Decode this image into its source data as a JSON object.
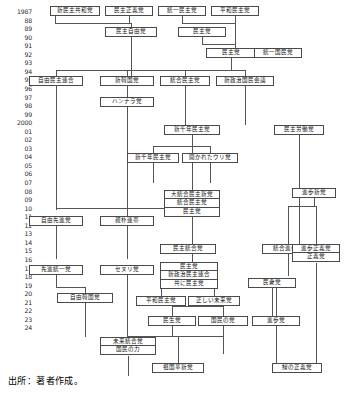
{
  "figure": {
    "caption": "出所：著者作成。",
    "years": [
      "1987",
      "88",
      "89",
      "90",
      "91",
      "92",
      "93",
      "94",
      "95",
      "96",
      "97",
      "98",
      "99",
      "2000",
      "01",
      "02",
      "03",
      "04",
      "05",
      "06",
      "07",
      "08",
      "09",
      "10",
      "11",
      "12",
      "13",
      "14",
      "15",
      "16",
      "17",
      "18",
      "19",
      "20",
      "21",
      "22",
      "23",
      "24"
    ]
  },
  "nodes": [
    {
      "id": "n1",
      "label": "新民主共和党",
      "x": 50,
      "y": 6,
      "w": 50,
      "h": 10
    },
    {
      "id": "n2",
      "label": "民主正義党",
      "x": 105,
      "y": 6,
      "w": 48,
      "h": 10
    },
    {
      "id": "n3",
      "label": "統一民主党",
      "x": 158,
      "y": 6,
      "w": 48,
      "h": 10
    },
    {
      "id": "n4",
      "label": "平和民主党",
      "x": 211,
      "y": 6,
      "w": 48,
      "h": 10
    },
    {
      "id": "n5",
      "label": "民主自由党",
      "x": 105,
      "y": 27,
      "w": 52,
      "h": 10
    },
    {
      "id": "n6",
      "label": "民主党",
      "x": 178,
      "y": 27,
      "w": 48,
      "h": 10
    },
    {
      "id": "n7",
      "label": "民主党",
      "x": 206,
      "y": 48,
      "w": 50,
      "h": 10
    },
    {
      "id": "n8",
      "label": "統一国民党",
      "x": 254,
      "y": 48,
      "w": 48,
      "h": 10
    },
    {
      "id": "n9",
      "label": "自由民主連合",
      "x": 29,
      "y": 76,
      "w": 54,
      "h": 10
    },
    {
      "id": "n10",
      "label": "新韓国党",
      "x": 100,
      "y": 76,
      "w": 54,
      "h": 10
    },
    {
      "id": "n11",
      "label": "統合民主党",
      "x": 160,
      "y": 76,
      "w": 50,
      "h": 10
    },
    {
      "id": "n12",
      "label": "新政治国民会議",
      "x": 216,
      "y": 76,
      "w": 58,
      "h": 10
    },
    {
      "id": "n13",
      "label": "ハンナラ党",
      "x": 100,
      "y": 97,
      "w": 54,
      "h": 10
    },
    {
      "id": "n14",
      "label": "新千年民主党",
      "x": 164,
      "y": 125,
      "w": 56,
      "h": 10
    },
    {
      "id": "n15",
      "label": "民主労働党",
      "x": 274,
      "y": 125,
      "w": 50,
      "h": 10
    },
    {
      "id": "n16",
      "label": "新千年民主党",
      "x": 127,
      "y": 153,
      "w": 52,
      "h": 10
    },
    {
      "id": "n17",
      "label": "開かれたウリ党",
      "x": 182,
      "y": 153,
      "w": 56,
      "h": 10
    },
    {
      "id": "n19",
      "label": "進歩新党",
      "x": 292,
      "y": 188,
      "w": 44,
      "h": 10
    },
    {
      "id": "n21",
      "label": "自由先進党",
      "x": 29,
      "y": 216,
      "w": 54,
      "h": 10
    },
    {
      "id": "n22",
      "label": "親朴連帯",
      "x": 100,
      "y": 216,
      "w": 54,
      "h": 10
    },
    {
      "id": "n24",
      "label": "先進統一党",
      "x": 29,
      "y": 265,
      "w": 54,
      "h": 10
    },
    {
      "id": "n25",
      "label": "セヌリ党",
      "x": 100,
      "y": 265,
      "w": 54,
      "h": 10
    },
    {
      "id": "n26",
      "label": "民主統合党",
      "x": 160,
      "y": 244,
      "w": 56,
      "h": 10
    },
    {
      "id": "n27",
      "label": "統合進歩党",
      "x": 262,
      "y": 244,
      "w": 52,
      "h": 10
    },
    {
      "id": "n29",
      "label": "自由韓国党",
      "x": 57,
      "y": 293,
      "w": 56,
      "h": 10
    },
    {
      "id": "n30",
      "label": "国民の党",
      "x": 166,
      "y": 278,
      "w": 52,
      "h": 10
    },
    {
      "id": "n31",
      "label": "民衆党",
      "x": 248,
      "y": 278,
      "w": 48,
      "h": 10
    },
    {
      "id": "n32",
      "label": "平和民主党",
      "x": 136,
      "y": 296,
      "w": 50,
      "h": 10
    },
    {
      "id": "n33",
      "label": "正しい未来党",
      "x": 188,
      "y": 296,
      "w": 52,
      "h": 10
    },
    {
      "id": "n34",
      "label": "民生党",
      "x": 148,
      "y": 316,
      "w": 48,
      "h": 10
    },
    {
      "id": "n35",
      "label": "国民の党",
      "x": 198,
      "y": 316,
      "w": 50,
      "h": 10
    },
    {
      "id": "n36",
      "label": "進歩党",
      "x": 252,
      "y": 316,
      "w": 48,
      "h": 10
    },
    {
      "id": "n39",
      "label": "祖国革新党",
      "x": 152,
      "y": 363,
      "w": 52,
      "h": 10
    },
    {
      "id": "n40",
      "label": "緑の正義党",
      "x": 272,
      "y": 363,
      "w": 50,
      "h": 10
    }
  ],
  "stacked_nodes": [
    {
      "id": "s1",
      "x": 164,
      "y": 190,
      "w": 56,
      "segments": [
        "大統合民主新党",
        "統合民主党",
        "民主党"
      ]
    },
    {
      "id": "s2",
      "x": 292,
      "y": 244,
      "w": 48,
      "segments": [
        "進歩正義党",
        "正義党"
      ]
    },
    {
      "id": "s3",
      "x": 160,
      "y": 262,
      "w": 58,
      "segments": [
        "民主党",
        "新政治民主連合",
        "共に民主党"
      ]
    },
    {
      "id": "s4",
      "x": 100,
      "y": 337,
      "w": 56,
      "segments": [
        "未来統合党",
        "国民の力"
      ]
    }
  ],
  "connectors": {
    "note": "vertical and horizontal rule segments linking party boxes",
    "vertical": [
      {
        "x": 55,
        "y": 16,
        "len": 7
      },
      {
        "x": 129,
        "y": 16,
        "len": 7
      },
      {
        "x": 182,
        "y": 16,
        "len": 7
      },
      {
        "x": 131,
        "y": 23,
        "len": 4
      },
      {
        "x": 235,
        "y": 16,
        "len": 32
      },
      {
        "x": 202,
        "y": 37,
        "len": 7
      },
      {
        "x": 131,
        "y": 37,
        "len": 39
      },
      {
        "x": 231,
        "y": 58,
        "len": 12
      },
      {
        "x": 56,
        "y": 70,
        "len": 6
      },
      {
        "x": 127,
        "y": 70,
        "len": 6
      },
      {
        "x": 185,
        "y": 70,
        "len": 6
      },
      {
        "x": 245,
        "y": 70,
        "len": 6
      },
      {
        "x": 127,
        "y": 86,
        "len": 11
      },
      {
        "x": 127,
        "y": 107,
        "len": 109
      },
      {
        "x": 185,
        "y": 86,
        "len": 39
      },
      {
        "x": 245,
        "y": 86,
        "len": 39
      },
      {
        "x": 192,
        "y": 125,
        "len": 10
      },
      {
        "x": 153,
        "y": 146,
        "len": 7
      },
      {
        "x": 210,
        "y": 146,
        "len": 7
      },
      {
        "x": 192,
        "y": 135,
        "len": 55
      },
      {
        "x": 153,
        "y": 163,
        "len": 20
      },
      {
        "x": 210,
        "y": 163,
        "len": 20
      },
      {
        "x": 192,
        "y": 217,
        "len": 45
      },
      {
        "x": 56,
        "y": 86,
        "len": 124
      },
      {
        "x": 56,
        "y": 226,
        "len": 33
      },
      {
        "x": 127,
        "y": 226,
        "len": 33
      },
      {
        "x": 127,
        "y": 275,
        "len": 62
      },
      {
        "x": 56,
        "y": 275,
        "len": 12
      },
      {
        "x": 85,
        "y": 287,
        "len": 6
      },
      {
        "x": 85,
        "y": 303,
        "len": 34
      },
      {
        "x": 128,
        "y": 337,
        "len": 0
      },
      {
        "x": 299,
        "y": 135,
        "len": 109
      },
      {
        "x": 314,
        "y": 198,
        "len": 8
      },
      {
        "x": 288,
        "y": 206,
        "len": 38
      },
      {
        "x": 316,
        "y": 206,
        "len": 38
      },
      {
        "x": 288,
        "y": 254,
        "len": 22
      },
      {
        "x": 316,
        "y": 263,
        "len": 100
      },
      {
        "x": 272,
        "y": 278,
        "len": 38
      },
      {
        "x": 276,
        "y": 288,
        "len": 28
      },
      {
        "x": 192,
        "y": 272,
        "len": 6
      },
      {
        "x": 161,
        "y": 288,
        "len": 8
      },
      {
        "x": 214,
        "y": 288,
        "len": 8
      },
      {
        "x": 172,
        "y": 306,
        "len": 10
      },
      {
        "x": 223,
        "y": 306,
        "len": 10
      },
      {
        "x": 172,
        "y": 326,
        "len": 10
      },
      {
        "x": 223,
        "y": 326,
        "len": 28
      },
      {
        "x": 276,
        "y": 326,
        "len": 37
      },
      {
        "x": 178,
        "y": 336,
        "len": 27
      },
      {
        "x": 128,
        "y": 356,
        "len": 20
      }
    ],
    "horizontal": [
      {
        "x": 55,
        "y": 23,
        "len": 76
      },
      {
        "x": 182,
        "y": 23,
        "len": 53
      },
      {
        "x": 202,
        "y": 44,
        "len": 33
      },
      {
        "x": 56,
        "y": 70,
        "len": 189
      },
      {
        "x": 153,
        "y": 146,
        "len": 57
      },
      {
        "x": 56,
        "y": 208,
        "len": 136
      },
      {
        "x": 56,
        "y": 287,
        "len": 29
      },
      {
        "x": 288,
        "y": 206,
        "len": 28
      },
      {
        "x": 161,
        "y": 288,
        "len": 53
      },
      {
        "x": 172,
        "y": 306,
        "len": 51
      },
      {
        "x": 128,
        "y": 336,
        "len": 95
      },
      {
        "x": 178,
        "y": 356,
        "len": 0
      }
    ]
  }
}
